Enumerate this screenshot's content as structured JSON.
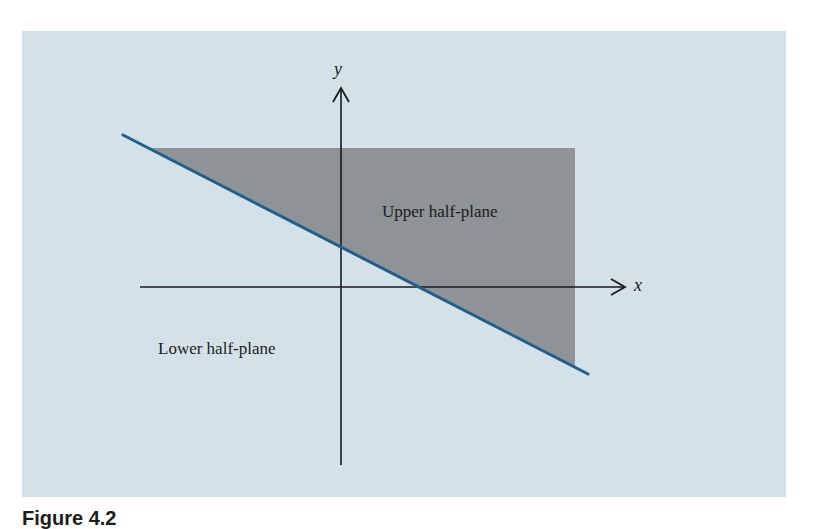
{
  "figure": {
    "caption": "Figure 4.2",
    "colors": {
      "background": "#d3e2e9",
      "shaded_region": "#8e9395",
      "boundary_line": "#1f5f8b",
      "axes": "#1a1a1a"
    },
    "axes": {
      "x_label": "x",
      "y_label": "y"
    },
    "regions": {
      "upper_label": "Upper half-plane",
      "lower_label": "Lower half-plane"
    }
  }
}
